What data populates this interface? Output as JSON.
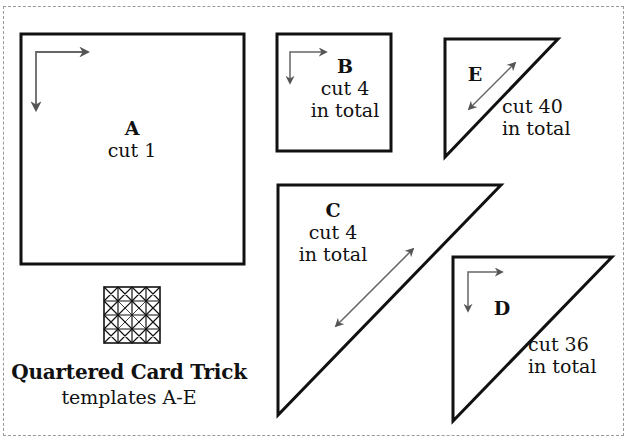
{
  "title": {
    "line1": "Quartered Card Trick",
    "line2": "templates A-E"
  },
  "templates": [
    {
      "id": "A",
      "shape": "square",
      "letter": "A",
      "cut": "cut 1",
      "extra": "",
      "grain": "corner-arrows"
    },
    {
      "id": "B",
      "shape": "square",
      "letter": "B",
      "cut": "cut 4",
      "extra": "in total",
      "grain": "corner-arrows"
    },
    {
      "id": "C",
      "shape": "half-square-triangle",
      "letter": "C",
      "cut": "cut 4",
      "extra": "in total",
      "grain": "diagonal-double-arrow"
    },
    {
      "id": "D",
      "shape": "half-square-triangle",
      "letter": "D",
      "cut": "cut 36",
      "extra": "in total",
      "grain": "corner-arrows"
    },
    {
      "id": "E",
      "shape": "half-square-triangle",
      "letter": "E",
      "cut": "cut 40",
      "extra": "in total",
      "grain": "diagonal-double-arrow"
    }
  ],
  "icons": {
    "block_preview": "quilt-block-icon"
  },
  "colors": {
    "outline": "#111111",
    "arrow": "#555555",
    "dashed_border": "#9a9a9a",
    "background": "#ffffff"
  }
}
